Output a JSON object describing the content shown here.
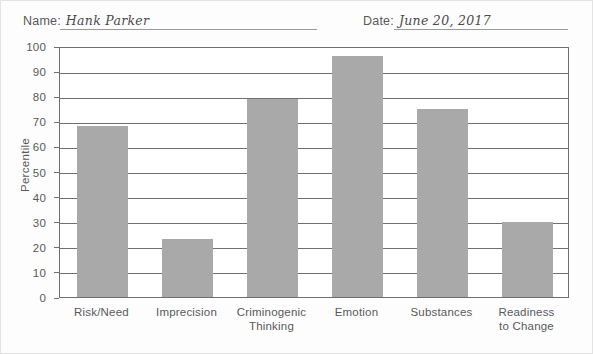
{
  "header": {
    "name_label": "Name:",
    "name_value": "Hank Parker",
    "date_label": "Date:",
    "date_value": "June 20, 2017"
  },
  "chart_data": {
    "type": "bar",
    "title": "",
    "xlabel": "",
    "ylabel": "Percentile",
    "ylim": [
      0,
      100
    ],
    "ytick_labels": [
      "100",
      "90",
      "80",
      "70",
      "60",
      "50",
      "40",
      "30",
      "20",
      "10",
      "0"
    ],
    "yticks": [
      100,
      90,
      80,
      70,
      60,
      50,
      40,
      30,
      20,
      10,
      0
    ],
    "grid": true,
    "legend": null,
    "bar_color": "#a9a9a9",
    "axis_color": "#6f6f71",
    "categories": [
      "Risk/Need",
      "Imprecision",
      "Criminogenic Thinking",
      "Emotion",
      "Substances",
      "Readiness to Change"
    ],
    "category_lines": [
      [
        "Risk/Need"
      ],
      [
        "Imprecision"
      ],
      [
        "Criminogenic",
        "Thinking"
      ],
      [
        "Emotion"
      ],
      [
        "Substances"
      ],
      [
        "Readiness",
        "to Change"
      ]
    ],
    "values": [
      68,
      23,
      79,
      96,
      75,
      30
    ]
  }
}
